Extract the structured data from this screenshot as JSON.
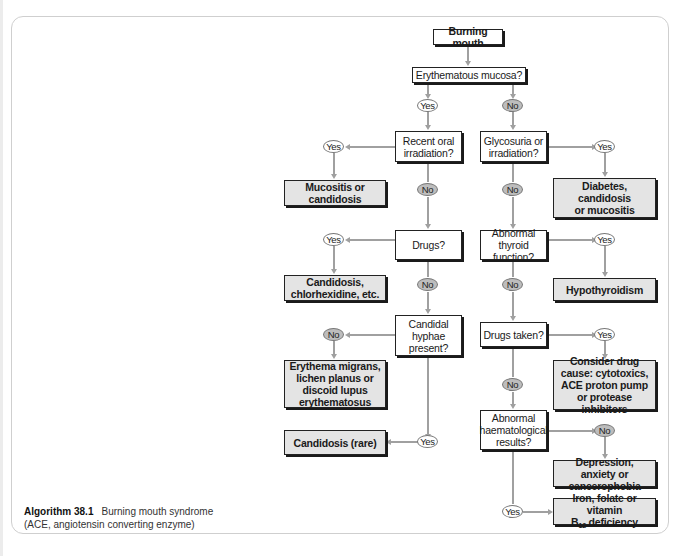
{
  "figure": {
    "caption": {
      "label": "Algorithm 38.1",
      "title": "Burning mouth syndrome",
      "note": "(ACE, angiotensin converting enzyme)"
    },
    "colors": {
      "result_box_fill": "#e4e4e4",
      "question_box_fill": "#ffffff",
      "no_oval_fill": "#bdbdbd",
      "yes_oval_fill": "#ffffff",
      "connector": "#a0a0a0",
      "border": "#222222"
    }
  },
  "nodes": {
    "start": "Burning mouth",
    "q_erythematous": "Erythematous mucosa?",
    "q_recent_irradiation": "Recent oral irradiation?",
    "q_glycosuria": "Glycosuria or irradiation?",
    "q_drugs": "Drugs?",
    "q_thyroid": "Abnormal thyroid function?",
    "q_candidal": "Candidal hyphae present?",
    "q_drugs_taken": "Drugs taken?",
    "q_haematological": "Abnormal haematological results?",
    "r_mucositis": "Mucositis or candidosis",
    "r_diabetes": "Diabetes, candidosis or mucositis",
    "r_candidosis_chlorhexidine": "Candidosis, chlorhexidine, etc.",
    "r_hypothyroidism": "Hypothyroidism",
    "r_erythema_migrans": "Erythema migrans, lichen planus or discoid lupus erythematosus",
    "r_drug_cause": "Consider drug cause: cytotoxics, ACE proton pump or protease inhibitors",
    "r_candidosis_rare": "Candidosis (rare)",
    "r_depression": "Depression, anxiety or cancerophobia",
    "r_iron_prefix": "Iron, folate or vitamin",
    "r_iron_b": "B",
    "r_iron_sub": "12",
    "r_iron_suffix": " deficiency"
  },
  "answers": {
    "yes": "Yes",
    "no": "No"
  }
}
